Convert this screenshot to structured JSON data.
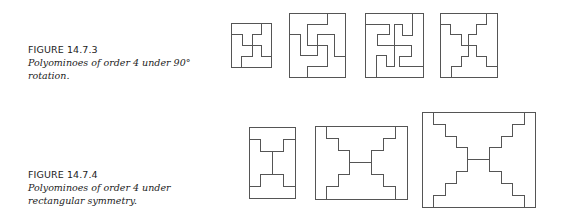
{
  "figures": [
    {
      "label": "FIGURE 14.7.3",
      "caption_line1": "Polyominoes of order 4 under 90°",
      "caption_line2": "rotation.",
      "diagram_count": 4
    },
    {
      "label": "FIGURE 14.7.4",
      "caption_line1": "Polyominoes of order 4 under",
      "caption_line2": "rectangular symmetry.",
      "diagram_count": 3
    }
  ],
  "colors": {
    "line": "#555555",
    "text": "#222222",
    "background": "#ffffff"
  }
}
